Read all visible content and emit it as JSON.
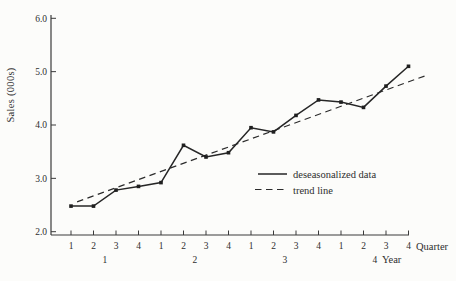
{
  "colors": {
    "background": "#fcfcfa",
    "ink": "#2e2e2e",
    "line": "#262626"
  },
  "chart_data": {
    "type": "line",
    "title": "",
    "ylabel": "Sales (000s)",
    "xlabel_quarter": "Quarter",
    "xlabel_year": "Year",
    "ylim": [
      2.0,
      6.0
    ],
    "yticks": [
      2.0,
      3.0,
      4.0,
      5.0,
      6.0
    ],
    "ytick_labels": [
      "2.0",
      "3.0",
      "4.0",
      "5.0",
      "6.0"
    ],
    "quarter_labels": [
      "1",
      "2",
      "3",
      "4",
      "1",
      "2",
      "3",
      "4",
      "1",
      "2",
      "3",
      "4",
      "1",
      "2",
      "3",
      "4"
    ],
    "year_labels": [
      "1",
      "2",
      "3",
      "4"
    ],
    "grid": false,
    "legend_position": "inside-lower-right",
    "series": [
      {
        "name": "deseasonalized data",
        "style": "solid",
        "marker": "square",
        "x_quarters": [
          1,
          2,
          3,
          4,
          5,
          6,
          7,
          8,
          9,
          10,
          11,
          12,
          13,
          14,
          15,
          16
        ],
        "values": [
          2.48,
          2.48,
          2.78,
          2.85,
          2.92,
          3.62,
          3.4,
          3.48,
          3.95,
          3.87,
          4.18,
          4.47,
          4.43,
          4.33,
          4.73,
          5.1
        ]
      },
      {
        "name": "trend line",
        "style": "dashed",
        "marker": "none",
        "start": {
          "t": 1.27,
          "value": 2.56
        },
        "end": {
          "t": 16.73,
          "value": 4.92
        }
      }
    ]
  }
}
